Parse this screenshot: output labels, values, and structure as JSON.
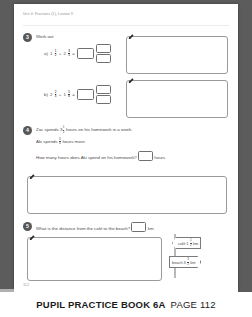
{
  "viewer": {
    "background_color": "#5c5c5c"
  },
  "page": {
    "header": "Unit 4: Fractions (1), Lesson 9",
    "page_number": "112"
  },
  "questions": [
    {
      "number": "3",
      "prompt": "Work out",
      "parts": [
        {
          "label": "a)",
          "term1_whole": "1",
          "term1_num": "1",
          "term1_den": "2",
          "operator": "+",
          "term2_whole": "2",
          "term2_num": "3",
          "term2_den": "5",
          "equals": "=",
          "answer_whole": "",
          "answer_num": "",
          "answer_den": ""
        },
        {
          "label": "b)",
          "term1_whole": "2",
          "term1_num": "2",
          "term1_den": "3",
          "operator": "+",
          "term2_whole": "1",
          "term2_num": "5",
          "term2_den": "6",
          "equals": "=",
          "answer_whole": "",
          "answer_num": "",
          "answer_den": ""
        }
      ],
      "working_boxes": [
        "",
        ""
      ]
    },
    {
      "number": "4",
      "lines": [
        {
          "pre": "Zac spends",
          "whole": "3",
          "num": "1",
          "den": "2",
          "post": "hours on his homework in a week."
        },
        {
          "pre": "Aki spends",
          "whole": "",
          "num": "3",
          "den": "4",
          "post": "hours more."
        }
      ],
      "final_question_pre": "How many hours does Aki spend on his homework?",
      "final_answer": "",
      "final_unit": "hours",
      "working_boxes": [
        ""
      ]
    },
    {
      "number": "5",
      "prompt": "What is the distance from the café to the beach?",
      "answer": "",
      "unit": "km",
      "working_boxes": [
        ""
      ],
      "signpost": {
        "signs": [
          {
            "label": "café",
            "whole": "1",
            "num": "1",
            "den": "2",
            "unit": "km",
            "direction": "left"
          },
          {
            "label": "beach",
            "whole": "3",
            "num": "3",
            "den": "5",
            "unit": "km",
            "direction": "right"
          }
        ]
      }
    }
  ],
  "footer": {
    "title": "PUPIL PRACTICE BOOK 6A",
    "page_label": "PAGE 112"
  },
  "icons": {
    "pencil": "pencil-icon"
  }
}
